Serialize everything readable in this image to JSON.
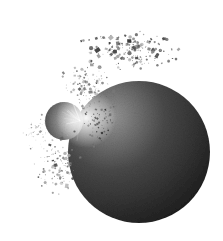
{
  "scene": {
    "subject": "planetary collision illustration",
    "background_color": "#ffffff",
    "width": 223,
    "height": 241
  },
  "planet": {
    "cx": 139,
    "cy": 152,
    "r": 71,
    "light_color": "#9a9a9a",
    "mid_color": "#4a4a4a",
    "dark_color": "#1c1c1c"
  },
  "moon": {
    "cx": 64,
    "cy": 121,
    "r": 19,
    "light_color": "#d8d8d8",
    "dark_color": "#3c3c3c"
  },
  "impact_glow": {
    "cx": 86,
    "cy": 118,
    "r": 30,
    "color": "#ffffff"
  },
  "debris": {
    "seed": 7,
    "clouds": [
      {
        "cx": 130,
        "cy": 50,
        "rx": 60,
        "ry": 22,
        "count": 170,
        "min_size": 0.8,
        "max_size": 4.2,
        "tone_min": 40,
        "tone_max": 170
      },
      {
        "cx": 90,
        "cy": 85,
        "rx": 35,
        "ry": 28,
        "count": 110,
        "min_size": 0.6,
        "max_size": 3.2,
        "tone_min": 60,
        "tone_max": 190
      },
      {
        "cx": 60,
        "cy": 165,
        "rx": 30,
        "ry": 40,
        "count": 130,
        "min_size": 0.6,
        "max_size": 3.4,
        "tone_min": 50,
        "tone_max": 190
      },
      {
        "cx": 100,
        "cy": 120,
        "rx": 25,
        "ry": 35,
        "count": 90,
        "min_size": 0.6,
        "max_size": 2.6,
        "tone_min": 30,
        "tone_max": 140
      },
      {
        "cx": 40,
        "cy": 130,
        "rx": 22,
        "ry": 25,
        "count": 60,
        "min_size": 0.5,
        "max_size": 2.0,
        "tone_min": 120,
        "tone_max": 210
      }
    ]
  }
}
